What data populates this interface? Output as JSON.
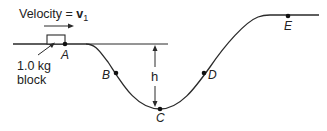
{
  "diagram": {
    "velocity_label": "Velocity = ",
    "velocity_symbol": "v",
    "velocity_subscript": "1",
    "block_label_line1": "1.0 kg",
    "block_label_line2": "block",
    "height_label": "h",
    "points": [
      {
        "name": "A",
        "x": 65,
        "y": 44
      },
      {
        "name": "B",
        "x": 116,
        "y": 73
      },
      {
        "name": "C",
        "x": 160,
        "y": 109
      },
      {
        "name": "D",
        "x": 204,
        "y": 73
      },
      {
        "name": "E",
        "x": 288,
        "y": 16
      }
    ],
    "colors": {
      "line": "#2a2a2a",
      "text": "#222222",
      "background": "#ffffff"
    }
  }
}
